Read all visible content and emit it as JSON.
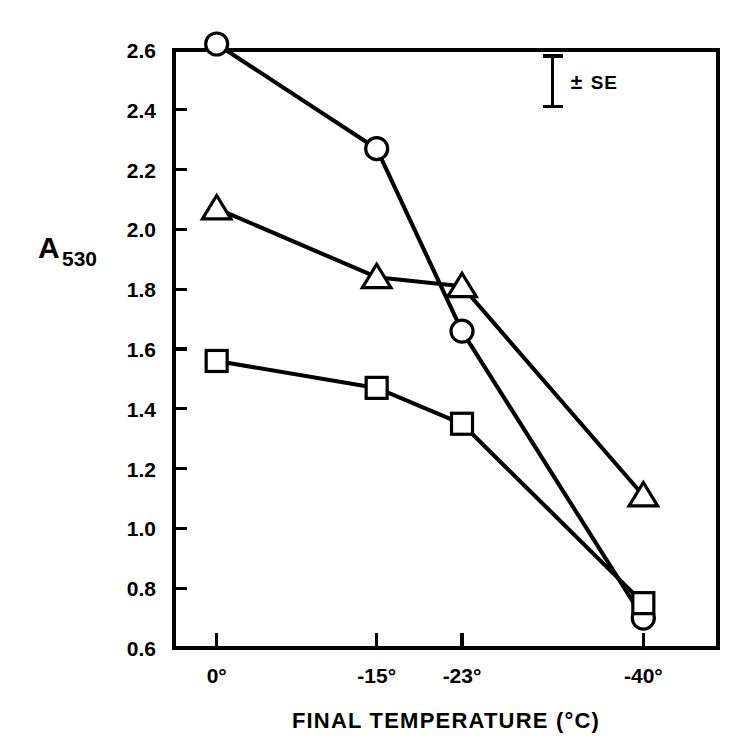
{
  "chart_data": {
    "type": "line",
    "title": "",
    "xlabel": "FINAL TEMPERATURE (°C)",
    "ylabel_main": "A",
    "ylabel_sub": "530",
    "categories": [
      "0°",
      "-15°",
      "-23°",
      "-40°"
    ],
    "x": [
      0,
      -15,
      -23,
      -40
    ],
    "xlim": [
      4,
      -47
    ],
    "ylim": [
      0.6,
      2.6
    ],
    "yticks": [
      "2.6",
      "2.4",
      "2.2",
      "2.0",
      "1.8",
      "1.6",
      "1.4",
      "1.2",
      "1.0",
      "0.8",
      "0.6"
    ],
    "ytick_values": [
      2.6,
      2.4,
      2.2,
      2.0,
      1.8,
      1.6,
      1.4,
      1.2,
      1.0,
      0.8,
      0.6
    ],
    "grid": false,
    "legend_position": "none",
    "series": [
      {
        "name": "circle-series",
        "marker": "circle",
        "values": [
          2.62,
          2.27,
          1.66,
          0.7
        ]
      },
      {
        "name": "triangle-series",
        "marker": "triangle",
        "values": [
          2.07,
          1.84,
          1.81,
          1.11
        ]
      },
      {
        "name": "square-series",
        "marker": "square",
        "values": [
          1.56,
          1.47,
          1.35,
          0.75
        ]
      }
    ],
    "annotations": [
      {
        "name": "standard-error-bar",
        "label": "SE",
        "prefix": "±",
        "top": 2.58,
        "bottom": 2.41,
        "x": -31.5
      }
    ],
    "line_color": "#000000",
    "marker_fill": "#ffffff",
    "background": "#ffffff"
  }
}
